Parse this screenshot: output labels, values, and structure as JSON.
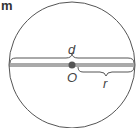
{
  "figure": {
    "label": "m",
    "labels": {
      "diameter": "d",
      "center": "O",
      "radius": "r"
    },
    "colors": {
      "stroke": "#555555",
      "center_point": "#555555",
      "text": "#444444"
    }
  }
}
